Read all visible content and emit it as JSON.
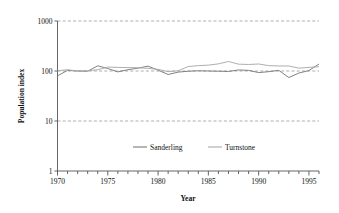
{
  "chart_data": {
    "type": "line",
    "title": "",
    "subtitle": "",
    "xlabel": "Year",
    "ylabel": "Population index",
    "xlim": [
      1970,
      1996
    ],
    "ylim": [
      1,
      1000
    ],
    "yscale": "log",
    "grid": "horizontal-dashed",
    "legend_position": "inside-bottom-center",
    "y_ticks": [
      1,
      10,
      100,
      1000
    ],
    "y_tick_labels": [
      "1",
      "10",
      "100",
      "1000"
    ],
    "x_ticks": [
      1970,
      1975,
      1980,
      1985,
      1990,
      1995
    ],
    "x_tick_labels": [
      "1970",
      "1975",
      "1980",
      "1985",
      "1990",
      "1995"
    ],
    "x_minor_tick_interval": 1,
    "x": [
      1970,
      1971,
      1972,
      1973,
      1974,
      1975,
      1976,
      1977,
      1978,
      1979,
      1980,
      1981,
      1982,
      1983,
      1984,
      1985,
      1986,
      1987,
      1988,
      1989,
      1990,
      1991,
      1992,
      1993,
      1994,
      1995,
      1996
    ],
    "series": [
      {
        "name": "Sanderling",
        "color": "#7a7a7a",
        "values": [
          80,
          103,
          100,
          99,
          127,
          112,
          96,
          106,
          114,
          125,
          104,
          85,
          95,
          99,
          101,
          100,
          99,
          98,
          105,
          103,
          93,
          97,
          103,
          74,
          91,
          102,
          138
        ]
      },
      {
        "name": "Turnstone",
        "color": "#aaaaaa",
        "values": [
          101,
          106,
          100,
          101,
          106,
          120,
          118,
          117,
          116,
          113,
          108,
          97,
          101,
          123,
          128,
          131,
          139,
          155,
          137,
          135,
          138,
          128,
          126,
          126,
          114,
          118,
          122
        ]
      }
    ]
  },
  "legend": {
    "items": [
      {
        "label": "Sanderling"
      },
      {
        "label": "Turnstone"
      }
    ]
  },
  "axes": {
    "x_title": "Year",
    "y_title": "Population index"
  }
}
